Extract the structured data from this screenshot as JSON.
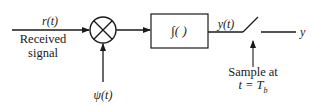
{
  "diagram": {
    "type": "correlator-receiver-block-diagram",
    "colors": {
      "stroke": "#1a1a1a",
      "background": "#ffffff"
    },
    "input": {
      "signal_label": "r(t)",
      "caption_line1": "Received",
      "caption_line2": "signal"
    },
    "multiplier": {
      "symbol": "×",
      "reference_label": "ψ(t)"
    },
    "integrator": {
      "label": "∫( )"
    },
    "output_before_sampler": {
      "label": "y(t)"
    },
    "sampler": {
      "caption_line1": "Sample at",
      "caption_line2": "t = T",
      "caption_subscript": "b"
    },
    "output": {
      "label": "y"
    }
  }
}
